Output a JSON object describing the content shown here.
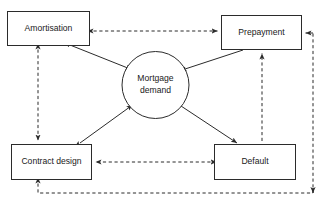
{
  "diagram": {
    "type": "flow-diagram",
    "background_color": "#ffffff",
    "line_color": "#2b2b2b",
    "nodes": [
      {
        "id": "amortisation",
        "label": "Amortisation",
        "shape": "rectangle",
        "x": 7,
        "y": 11,
        "width": 83,
        "height": 35,
        "cx": 48.5,
        "cy": 28.5
      },
      {
        "id": "prepayment",
        "label": "Prepayment",
        "shape": "rectangle",
        "x": 221,
        "y": 15,
        "width": 81,
        "height": 35,
        "cx": 261.5,
        "cy": 32.5
      },
      {
        "id": "mortgage_demand",
        "label_line1": "Mortgage",
        "label_line2": "demand",
        "shape": "circle",
        "cx": 155.5,
        "cy": 85,
        "r": 33.5
      },
      {
        "id": "contract_design",
        "label": "Contract design",
        "shape": "rectangle",
        "x": 11,
        "y": 144,
        "width": 81,
        "height": 36,
        "cx": 51.5,
        "cy": 162
      },
      {
        "id": "default",
        "label": "Default",
        "shape": "rectangle",
        "x": 214,
        "y": 144,
        "width": 82,
        "height": 36,
        "cx": 255,
        "cy": 162
      }
    ],
    "edges": [
      {
        "id": "amortisation-mortgage",
        "from": "amortisation",
        "to": "mortgage_demand",
        "style": "solid",
        "arrows": "both"
      },
      {
        "id": "prepayment-mortgage",
        "from": "prepayment",
        "to": "mortgage_demand",
        "style": "solid",
        "arrows": "to"
      },
      {
        "id": "contract-mortgage",
        "from": "contract_design",
        "to": "mortgage_demand",
        "style": "solid",
        "arrows": "both"
      },
      {
        "id": "mortgage-default",
        "from": "mortgage_demand",
        "to": "default",
        "style": "solid",
        "arrows": "both"
      },
      {
        "id": "amortisation-prepayment",
        "from": "prepayment",
        "to": "amortisation",
        "style": "dashed",
        "arrows": "both"
      },
      {
        "id": "amortisation-contract",
        "from": "amortisation",
        "to": "contract_design",
        "style": "dashed",
        "arrows": "both"
      },
      {
        "id": "contract-default",
        "from": "default",
        "to": "contract_design",
        "style": "dashed",
        "arrows": "both"
      },
      {
        "id": "default-prepayment",
        "from": "default",
        "to": "prepayment",
        "style": "dashed",
        "arrows": "to"
      },
      {
        "id": "contract-prepayment-loop",
        "from": "contract_design",
        "to": "prepayment",
        "style": "dashed",
        "arrows": "both",
        "routing": "bottom-right-around"
      }
    ]
  }
}
